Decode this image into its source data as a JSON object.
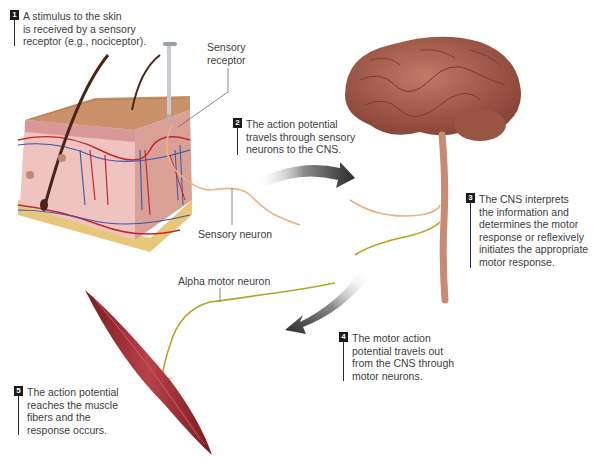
{
  "diagram": {
    "steps": [
      {
        "number": "1",
        "text": "A stimulus to the skin\nis received by a sensory\nreceptor (e.g., nociceptor)."
      },
      {
        "number": "2",
        "text": "The action potential\ntravels through sensory\nneurons to the CNS."
      },
      {
        "number": "3",
        "text": "The CNS interprets\nthe information and\ndetermines the motor\nresponse or reflexively\ninitiates the appropriate\nmotor response."
      },
      {
        "number": "4",
        "text": "The motor action\npotential travels out\nfrom the CNS through\nmotor neurons."
      },
      {
        "number": "5",
        "text": "The action potential\nreaches the muscle\nfibers and the\nresponse occurs."
      }
    ],
    "labels": {
      "sensory_receptor": "Sensory\nreceptor",
      "sensory_neuron": "Sensory neuron",
      "alpha_motor_neuron": "Alpha motor neuron"
    },
    "structures": [
      "skin-block",
      "pin-stimulus",
      "brain",
      "spinal-cord",
      "muscle"
    ],
    "colors": {
      "skin_top": "#c9926a",
      "dermis": "#e8b4b0",
      "fat": "#e9c77a",
      "artery": "#c0262a",
      "vein": "#3b55a8",
      "brain": "#a8584a",
      "sensory_neuron": "#f0b080",
      "motor_neuron": "#b8a22a",
      "muscle": "#9c2a30",
      "arrow": "#333333",
      "badge": "#1a1a1a"
    }
  }
}
